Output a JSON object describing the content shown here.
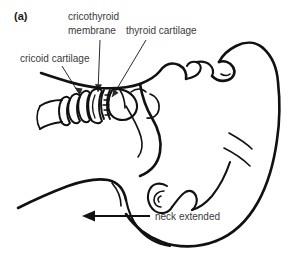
{
  "figure": {
    "panel_label": "(a)",
    "type": "anatomical-line-diagram",
    "background_color": "#ffffff",
    "line_color": "#111111",
    "text_color": "#3a3a3a"
  },
  "annotations": {
    "cricoid_cartilage": "cricoid cartilage",
    "cricothyroid_membrane_line1": "cricothyroid",
    "cricothyroid_membrane_line2": "membrane",
    "thyroid_cartilage": "thyroid cartilage",
    "neck_extended": "neck extended"
  }
}
